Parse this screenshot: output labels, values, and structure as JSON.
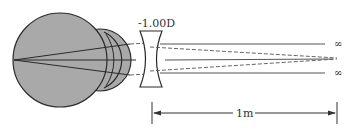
{
  "diagram": {
    "lens_label": "-1.00D",
    "distance_label": "1m",
    "infinity_top": "∞",
    "infinity_bottom": "∞",
    "colors": {
      "eye_fill": "#a9a9a9",
      "outline": "#2a2a2a",
      "ray": "#555555"
    }
  }
}
